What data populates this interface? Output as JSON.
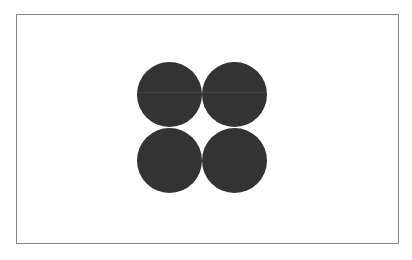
{
  "canvas": {
    "background": "#ffffff",
    "frame_border_color": "#8a8a8a"
  },
  "shapes": {
    "fill_color": "#333333",
    "circles": [
      {
        "name": "top-left",
        "cx": 169,
        "cy": 94,
        "r": 32
      },
      {
        "name": "top-right",
        "cx": 234,
        "cy": 94,
        "r": 32
      },
      {
        "name": "bottom-left",
        "cx": 169,
        "cy": 160,
        "r": 32
      },
      {
        "name": "bottom-right",
        "cx": 234,
        "cy": 160,
        "r": 32
      }
    ]
  }
}
